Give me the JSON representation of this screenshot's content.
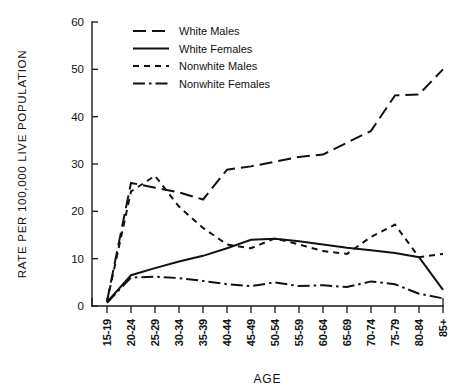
{
  "chart_data": {
    "type": "line",
    "title": "",
    "xlabel": "AGE",
    "ylabel": "RATE PER 100,000 LIVE POPULATION",
    "ylim": [
      0,
      60
    ],
    "yticks": [
      0,
      10,
      20,
      30,
      40,
      50,
      60
    ],
    "grid": false,
    "legend_position": "top-left-inside",
    "categories": [
      "15-19",
      "20-24",
      "25-29",
      "30-34",
      "35-39",
      "40-44",
      "45-49",
      "50-54",
      "55-59",
      "60-64",
      "65-69",
      "70-74",
      "75-79",
      "80-84",
      "85+"
    ],
    "series": [
      {
        "name": "White Males",
        "dash": "long-dash",
        "values": [
          1.0,
          26.0,
          25.0,
          24.0,
          22.5,
          28.8,
          29.5,
          30.5,
          31.5,
          32.0,
          34.5,
          37.0,
          44.5,
          44.7,
          50.0
        ]
      },
      {
        "name": "White Females",
        "dash": "solid",
        "values": [
          0.8,
          6.5,
          8.0,
          9.4,
          10.6,
          12.2,
          14.0,
          14.2,
          13.7,
          13.0,
          12.3,
          11.8,
          11.2,
          10.3,
          3.4
        ]
      },
      {
        "name": "Nonwhite Males",
        "dash": "short-dash",
        "values": [
          0.9,
          24.2,
          27.5,
          21.0,
          16.5,
          13.0,
          12.2,
          14.3,
          13.0,
          11.6,
          11.0,
          14.6,
          17.2,
          10.3,
          11.0
        ]
      },
      {
        "name": "Nonwhite Females",
        "dash": "dash-dot",
        "values": [
          0.7,
          6.0,
          6.2,
          5.9,
          5.3,
          4.6,
          4.2,
          5.0,
          4.2,
          4.4,
          4.0,
          5.2,
          4.6,
          2.6,
          1.6
        ]
      }
    ]
  },
  "legend": {
    "items": [
      {
        "label": "White Males",
        "dash": "long-dash"
      },
      {
        "label": "White Females",
        "dash": "solid"
      },
      {
        "label": "Nonwhite Males",
        "dash": "short-dash"
      },
      {
        "label": "Nonwhite Females",
        "dash": "dash-dot"
      }
    ]
  },
  "colors": {
    "ink": "#111111",
    "background": "#ffffff"
  }
}
